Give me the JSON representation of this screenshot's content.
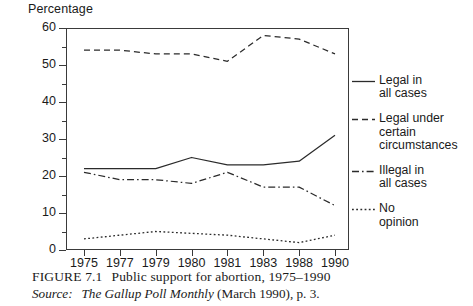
{
  "figure": {
    "caption_figure_no": "FIGURE 7.1",
    "caption_title": "Public support for abortion, 1975–1990",
    "source_label": "Source:",
    "source_publication": "The Gallup Poll Monthly",
    "source_rest": "(March 1990), p. 3."
  },
  "chart_data": {
    "type": "line",
    "title": "Public support for abortion, 1975–1990",
    "xlabel": "",
    "ylabel": "Percentage",
    "ylim": [
      0,
      60
    ],
    "yticks": [
      0,
      10,
      20,
      30,
      40,
      50,
      60
    ],
    "ytick_labels": [
      "0",
      "10",
      "20",
      "30",
      "40",
      "50",
      "60"
    ],
    "yminor_step": 5,
    "grid": false,
    "legend_position": "right",
    "categories": [
      "1975",
      "1977",
      "1979",
      "1980",
      "1981",
      "1983",
      "1988",
      "1990"
    ],
    "series": [
      {
        "name": "Legal in\nall cases",
        "legend_label": "Legal in\nall cases",
        "style": "solid",
        "color": "#2b2b2b",
        "values": [
          22,
          22,
          22,
          25,
          23,
          23,
          24,
          31
        ]
      },
      {
        "name": "Legal under\ncertain\ncircumstances",
        "legend_label": "Legal under\ncertain\ncircumstances",
        "style": "dashed",
        "color": "#2b2b2b",
        "values": [
          54,
          54,
          53,
          53,
          51,
          58,
          57,
          53
        ]
      },
      {
        "name": "Illegal in\nall cases",
        "legend_label": "Illegal in\nall cases",
        "style": "dash-dot",
        "color": "#2b2b2b",
        "values": [
          21,
          19,
          19,
          18,
          21,
          17,
          17,
          12
        ]
      },
      {
        "name": "No\nopinion",
        "legend_label": "No\nopinion",
        "style": "dotted",
        "color": "#2b2b2b",
        "values": [
          3,
          4,
          5,
          4.5,
          4,
          3,
          2,
          4
        ]
      }
    ]
  }
}
